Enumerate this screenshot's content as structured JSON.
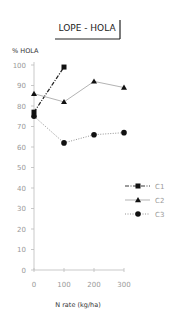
{
  "chart_data": {
    "type": "line",
    "title": "LOPE - HOLA",
    "xlabel": "N rate (kg/ha)",
    "ylabel": "% HOLA",
    "xlim": [
      0,
      300
    ],
    "ylim": [
      0,
      100
    ],
    "x_ticks": [
      0,
      100,
      200,
      300
    ],
    "y_ticks": [
      0,
      10,
      20,
      30,
      40,
      50,
      60,
      70,
      80,
      90,
      100
    ],
    "grid": false,
    "legend_position": "right-middle",
    "series": [
      {
        "name": "C1",
        "marker": "square",
        "line": "dash-dot",
        "x": [
          0,
          100
        ],
        "values": [
          77,
          99
        ]
      },
      {
        "name": "C2",
        "marker": "triangle",
        "line": "solid",
        "x": [
          0,
          100,
          200,
          300
        ],
        "values": [
          86,
          82,
          92,
          89
        ]
      },
      {
        "name": "C3",
        "marker": "circle",
        "line": "dotted",
        "x": [
          0,
          100,
          200,
          300
        ],
        "values": [
          75,
          62,
          66,
          67
        ]
      }
    ]
  }
}
